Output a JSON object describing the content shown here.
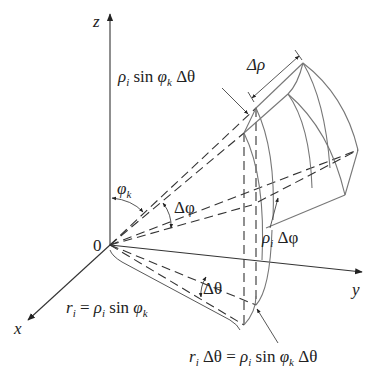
{
  "diagram": {
    "type": "spherical-wedge-volume-element",
    "axes": {
      "z": "z",
      "x": "x",
      "y": "y",
      "origin": "0"
    },
    "labels": {
      "top_arc": {
        "rho": "ρ",
        "rho_sub": "i",
        "sin": " sin ",
        "phi": "φ",
        "phi_sub": "k",
        "delta_theta": " Δθ"
      },
      "delta_rho": "Δρ",
      "phi_k": {
        "phi": "φ",
        "sub": "k"
      },
      "delta_phi": "Δφ",
      "rho_delta_phi": {
        "rho": "ρ",
        "sub": "i",
        "rest": " Δφ"
      },
      "delta_theta": "Δθ",
      "r_eq": {
        "r": "r",
        "r_sub": "i",
        "eq": " = ",
        "rho": "ρ",
        "rho_sub": "i",
        "sin": " sin ",
        "phi": "φ",
        "phi_sub": "k"
      },
      "arc_eq": {
        "r": "r",
        "r_sub": "i",
        "dt": " Δθ",
        "eq": " = ",
        "rho": "ρ",
        "rho_sub": "i",
        "sin": " sin ",
        "phi": "φ",
        "phi_sub": "k",
        "dt2": " Δθ"
      }
    },
    "colors": {
      "line": "#333333",
      "wedge_line": "#777777",
      "background": "#ffffff"
    }
  }
}
